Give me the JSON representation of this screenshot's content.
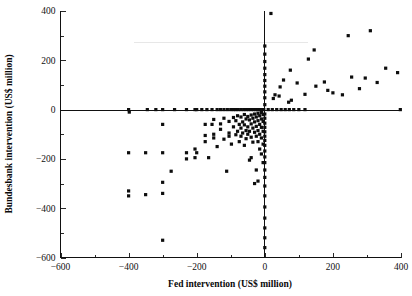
{
  "chart_data": {
    "type": "scatter",
    "title": "",
    "xlabel": "Fed intervention (US$ million)",
    "ylabel": "Bundesbank intervention (US$ million)",
    "xlim": [
      -600,
      400
    ],
    "ylim": [
      -600,
      400
    ],
    "xticks": [
      -600,
      -400,
      -200,
      0,
      200,
      400
    ],
    "xtick_labels": [
      "-600",
      "-400",
      "-200",
      "0",
      "200",
      "400"
    ],
    "yticks": [
      -600,
      -400,
      -200,
      0,
      200,
      400
    ],
    "ytick_labels": [
      "-600",
      "-400",
      "-200",
      "0",
      "200",
      "400"
    ],
    "minor_tick_step": 100,
    "grid": false,
    "legend": false,
    "marker": "square",
    "marker_color": "#0d0d0d",
    "marker_size": 3.2,
    "zero_lines": true,
    "points": [
      [
        -400,
        0
      ],
      [
        -398,
        -10
      ],
      [
        -345,
        0
      ],
      [
        -320,
        0
      ],
      [
        -300,
        0
      ],
      [
        -265,
        0
      ],
      [
        -230,
        0
      ],
      [
        -205,
        0
      ],
      [
        -200,
        0
      ],
      [
        -185,
        0
      ],
      [
        -170,
        0
      ],
      [
        -155,
        0
      ],
      [
        -140,
        0
      ],
      [
        -130,
        0
      ],
      [
        -120,
        0
      ],
      [
        -110,
        0
      ],
      [
        -100,
        0
      ],
      [
        -92,
        0
      ],
      [
        -85,
        0
      ],
      [
        -78,
        0
      ],
      [
        -70,
        0
      ],
      [
        -62,
        0
      ],
      [
        -55,
        0
      ],
      [
        -48,
        0
      ],
      [
        -40,
        0
      ],
      [
        -33,
        0
      ],
      [
        -26,
        0
      ],
      [
        -20,
        0
      ],
      [
        -14,
        0
      ],
      [
        -8,
        0
      ],
      [
        -3,
        0
      ],
      [
        -300,
        -60
      ],
      [
        -300,
        -175
      ],
      [
        -300,
        -295
      ],
      [
        -300,
        -340
      ],
      [
        -300,
        -530
      ],
      [
        -400,
        -175
      ],
      [
        -400,
        -330
      ],
      [
        -400,
        -350
      ],
      [
        -350,
        -175
      ],
      [
        -350,
        -345
      ],
      [
        -275,
        -250
      ],
      [
        -230,
        -175
      ],
      [
        -230,
        -200
      ],
      [
        -205,
        -160
      ],
      [
        -205,
        -195
      ],
      [
        -200,
        -175
      ],
      [
        -175,
        -60
      ],
      [
        -175,
        -105
      ],
      [
        -175,
        -130
      ],
      [
        -165,
        -195
      ],
      [
        -155,
        -60
      ],
      [
        -150,
        -40
      ],
      [
        -150,
        -100
      ],
      [
        -150,
        -115
      ],
      [
        -140,
        -150
      ],
      [
        -130,
        -58
      ],
      [
        -130,
        -80
      ],
      [
        -120,
        -35
      ],
      [
        -120,
        -120
      ],
      [
        -112,
        -250
      ],
      [
        -105,
        -48
      ],
      [
        -105,
        -95
      ],
      [
        -105,
        -108
      ],
      [
        -98,
        -140
      ],
      [
        -92,
        -32
      ],
      [
        -92,
        -70
      ],
      [
        -85,
        -45
      ],
      [
        -85,
        -102
      ],
      [
        -80,
        -25
      ],
      [
        -80,
        -88
      ],
      [
        -75,
        -60
      ],
      [
        -75,
        -130
      ],
      [
        -70,
        -30
      ],
      [
        -70,
        -75
      ],
      [
        -70,
        -108
      ],
      [
        -65,
        -50
      ],
      [
        -65,
        -95
      ],
      [
        -60,
        -20
      ],
      [
        -60,
        -62
      ],
      [
        -60,
        -145
      ],
      [
        -55,
        -38
      ],
      [
        -55,
        -85
      ],
      [
        -55,
        -118
      ],
      [
        -50,
        -28
      ],
      [
        -50,
        -70
      ],
      [
        -50,
        -100
      ],
      [
        -45,
        -42
      ],
      [
        -45,
        -88
      ],
      [
        -45,
        -205
      ],
      [
        -40,
        -22
      ],
      [
        -40,
        -58
      ],
      [
        -40,
        -112
      ],
      [
        -40,
        -195
      ],
      [
        -35,
        -35
      ],
      [
        -35,
        -75
      ],
      [
        -35,
        -132
      ],
      [
        -30,
        -18
      ],
      [
        -30,
        -50
      ],
      [
        -30,
        -92
      ],
      [
        -30,
        -300
      ],
      [
        -25,
        -30
      ],
      [
        -25,
        -68
      ],
      [
        -25,
        -108
      ],
      [
        -25,
        -245
      ],
      [
        -20,
        -15
      ],
      [
        -20,
        -45
      ],
      [
        -20,
        -85
      ],
      [
        -20,
        -130
      ],
      [
        -20,
        -290
      ],
      [
        -15,
        -25
      ],
      [
        -15,
        -60
      ],
      [
        -15,
        -100
      ],
      [
        -15,
        -160
      ],
      [
        -10,
        -12
      ],
      [
        -10,
        -38
      ],
      [
        -10,
        -72
      ],
      [
        -10,
        -115
      ],
      [
        -10,
        -180
      ],
      [
        -5,
        -20
      ],
      [
        -5,
        -48
      ],
      [
        -5,
        -88
      ],
      [
        -5,
        -140
      ],
      [
        -5,
        -215
      ],
      [
        0,
        -18
      ],
      [
        0,
        -35
      ],
      [
        0,
        -55
      ],
      [
        0,
        -72
      ],
      [
        0,
        -90
      ],
      [
        0,
        -108
      ],
      [
        0,
        -125
      ],
      [
        0,
        -145
      ],
      [
        0,
        -168
      ],
      [
        0,
        -192
      ],
      [
        0,
        -215
      ],
      [
        0,
        -245
      ],
      [
        0,
        -275
      ],
      [
        0,
        -310
      ],
      [
        0,
        -350
      ],
      [
        0,
        -395
      ],
      [
        0,
        -440
      ],
      [
        0,
        -480
      ],
      [
        0,
        -520
      ],
      [
        0,
        -560
      ],
      [
        0,
        20
      ],
      [
        0,
        48
      ],
      [
        0,
        72
      ],
      [
        0,
        95
      ],
      [
        0,
        118
      ],
      [
        0,
        142
      ],
      [
        0,
        168
      ],
      [
        0,
        195
      ],
      [
        0,
        225
      ],
      [
        0,
        258
      ],
      [
        10,
        0
      ],
      [
        22,
        0
      ],
      [
        35,
        0
      ],
      [
        48,
        0
      ],
      [
        60,
        0
      ],
      [
        72,
        0
      ],
      [
        85,
        0
      ],
      [
        100,
        0
      ],
      [
        118,
        0
      ],
      [
        398,
        0
      ],
      [
        18,
        390
      ],
      [
        25,
        45
      ],
      [
        30,
        60
      ],
      [
        42,
        55
      ],
      [
        45,
        92
      ],
      [
        55,
        120
      ],
      [
        70,
        30
      ],
      [
        75,
        160
      ],
      [
        78,
        38
      ],
      [
        95,
        108
      ],
      [
        118,
        62
      ],
      [
        128,
        205
      ],
      [
        145,
        242
      ],
      [
        150,
        95
      ],
      [
        175,
        112
      ],
      [
        185,
        78
      ],
      [
        200,
        68
      ],
      [
        228,
        60
      ],
      [
        245,
        300
      ],
      [
        255,
        132
      ],
      [
        278,
        85
      ],
      [
        295,
        128
      ],
      [
        310,
        320
      ],
      [
        330,
        110
      ],
      [
        355,
        168
      ],
      [
        390,
        150
      ]
    ]
  },
  "figure": {
    "x_axis_title": "Fed intervention (US$ million)",
    "y_axis_title": "Bundesbank intervention (US$ million)"
  }
}
